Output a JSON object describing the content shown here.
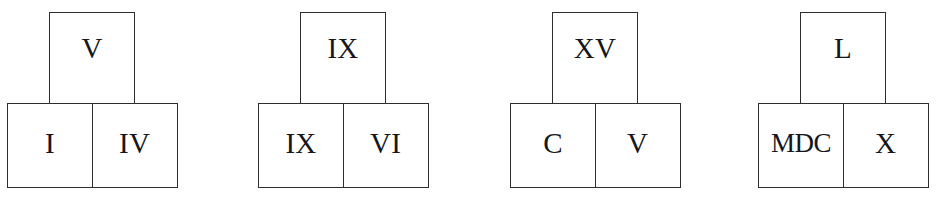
{
  "diagram": {
    "kind": "roman-numeral-addition-pyramids",
    "pyramid_count": 4,
    "colors": {
      "background": "#ffffff",
      "stroke": "#2e2e2e",
      "text": "#17171a"
    },
    "pyramids": [
      {
        "name": "pyramid-1",
        "top": "V",
        "bottom_left": "I",
        "bottom_right": "IV"
      },
      {
        "name": "pyramid-2",
        "top": "IX",
        "bottom_left": "IX",
        "bottom_right": "VI"
      },
      {
        "name": "pyramid-3",
        "top": "XV",
        "bottom_left": "C",
        "bottom_right": "V"
      },
      {
        "name": "pyramid-4",
        "top": "L",
        "bottom_left": "MDC",
        "bottom_right": "X"
      }
    ]
  }
}
